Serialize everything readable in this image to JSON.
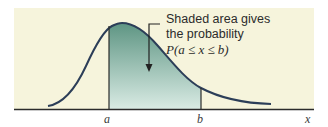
{
  "figure": {
    "callout": {
      "line1": "Shaded area gives",
      "line2": "the probability",
      "formula": "P(a ≤ x ≤ b)"
    },
    "axis": {
      "label_a": "a",
      "label_b": "b",
      "label_x": "x"
    },
    "colors": {
      "background": "#f6f4dc",
      "curve": "#2c3e58",
      "shade_top": "#5e9583",
      "shade_bottom": "#d9ebe4",
      "axis": "#2b2b2b"
    }
  }
}
